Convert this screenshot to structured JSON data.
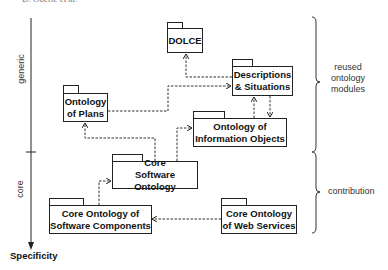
{
  "header": {
    "text": "D. Oberle et al."
  },
  "axis": {
    "label": "Specificity",
    "regions": [
      {
        "label": "generic"
      },
      {
        "label": "core"
      }
    ]
  },
  "braces": [
    {
      "label_lines": [
        "reused",
        "ontology",
        "modules"
      ]
    },
    {
      "label": "contribution"
    }
  ],
  "packages": {
    "dolce": {
      "lines": [
        "DOLCE"
      ]
    },
    "ds": {
      "lines": [
        "Descriptions",
        "& Situations"
      ]
    },
    "plans": {
      "lines": [
        "Ontology",
        "of Plans"
      ]
    },
    "infoobj": {
      "lines": [
        "Ontology of",
        "Information Objects"
      ]
    },
    "cso": {
      "lines": [
        "Core",
        "Software Ontology"
      ]
    },
    "csc": {
      "lines": [
        "Core Ontology of",
        "Software Components"
      ]
    },
    "ws": {
      "lines": [
        "Core Ontology",
        "of Web Services"
      ]
    }
  },
  "dependencies": [
    {
      "from": "Descriptions & Situations",
      "to": "DOLCE"
    },
    {
      "from": "Ontology of Plans",
      "to": "Descriptions & Situations"
    },
    {
      "from": "Ontology of Information Objects",
      "to": "Descriptions & Situations"
    },
    {
      "from": "Descriptions & Situations",
      "to": "Ontology of Information Objects"
    },
    {
      "from": "Core Software Ontology",
      "to": "Ontology of Plans"
    },
    {
      "from": "Core Software Ontology",
      "to": "Ontology of Information Objects"
    },
    {
      "from": "Core Ontology of Software Components",
      "to": "Core Software Ontology"
    },
    {
      "from": "Core Ontology of Web Services",
      "to": "Core Ontology of Software Components"
    }
  ]
}
